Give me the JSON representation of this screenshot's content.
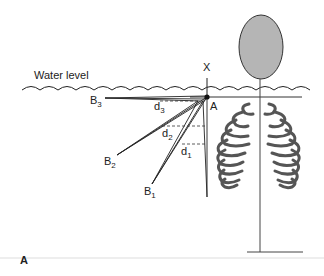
{
  "figure": {
    "panel_label": "A",
    "water_label": "Water level",
    "axis_label": "X",
    "point_label": "A",
    "sources": [
      {
        "label": "B",
        "sub": "3"
      },
      {
        "label": "B",
        "sub": "2"
      },
      {
        "label": "B",
        "sub": "1"
      }
    ],
    "distances": [
      {
        "label": "d",
        "sub": "3"
      },
      {
        "label": "d",
        "sub": "2"
      },
      {
        "label": "d",
        "sub": "1"
      }
    ],
    "colors": {
      "line": "#222222",
      "head_fill": "#b5b5b5",
      "ribs": "#555555",
      "separator": "#dddddd"
    }
  }
}
